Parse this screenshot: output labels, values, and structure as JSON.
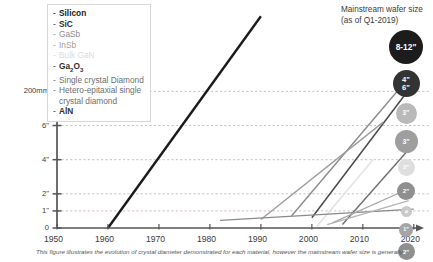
{
  "chart_data": {
    "type": "line",
    "title": "",
    "xlabel": "",
    "ylabel": "",
    "xlim": [
      1950,
      2022
    ],
    "ylim": [
      0,
      13
    ],
    "grid": "horizontal-dashed",
    "legend_position": "top-left-inside",
    "x_ticks": [
      "1950",
      "1960",
      "1970",
      "1980",
      "1990",
      "2000",
      "2010",
      "2020"
    ],
    "x_tick_values": [
      1950,
      1960,
      1970,
      1980,
      1990,
      2000,
      2010,
      2020
    ],
    "y_ticks": [
      "0",
      "1\"",
      "2\"",
      "4\"",
      "6\"",
      "200mm"
    ],
    "y_tick_values": [
      0,
      1,
      2,
      4,
      6,
      8
    ],
    "series": [
      {
        "name": "Silicon",
        "color": "#1a1a1a",
        "width": 2.4,
        "points": [
          [
            1960,
            0
          ],
          [
            1990,
            12.4
          ]
        ]
      },
      {
        "name": "SiC",
        "color": "#4a4a4a",
        "width": 1.5,
        "points": [
          [
            2000,
            0.6
          ],
          [
            2019,
            8.1
          ]
        ]
      },
      {
        "name": "GaSb",
        "color": "#8c8c8c",
        "width": 1.4,
        "points": [
          [
            1996,
            0.7
          ],
          [
            2017,
            8.1
          ]
        ]
      },
      {
        "name": "InSb",
        "color": "#9d9d9d",
        "width": 1.4,
        "points": [
          [
            1990,
            0.5
          ],
          [
            2014,
            6.2
          ]
        ]
      },
      {
        "name": "Bulk GaN",
        "color": "#e2e2e2",
        "width": 1.4,
        "points": [
          [
            2001,
            0.1
          ],
          [
            2012,
            4.0
          ]
        ]
      },
      {
        "name": "Ga2O3",
        "color": "#6e6e6e",
        "width": 1.4,
        "points": [
          [
            2006,
            0.2
          ],
          [
            2019,
            4.6
          ]
        ]
      },
      {
        "name": "Single crystal Diamond",
        "color": "#8a8a8a",
        "width": 1.3,
        "points": [
          [
            1982,
            0.45
          ],
          [
            2020,
            1.1
          ]
        ]
      },
      {
        "name": "Hetero-epitaxial single crystal diamond",
        "color": "#a8a8a8",
        "width": 1.3,
        "points": [
          [
            2004,
            0.3
          ],
          [
            2019,
            2.3
          ]
        ]
      },
      {
        "name": "AlN",
        "color": "#b5b5b5",
        "width": 1.3,
        "points": [
          [
            2003,
            0.2
          ],
          [
            2019,
            1.6
          ]
        ]
      }
    ]
  },
  "legend": {
    "items": [
      {
        "dash": "-",
        "label": "Silicon",
        "color": "#1a1a1a",
        "strong": true
      },
      {
        "dash": "-",
        "label": "SiC",
        "color": "#2e2e2e",
        "strong": true
      },
      {
        "dash": "-",
        "label": "GaSb",
        "color": "#8c8c8c",
        "strong": false
      },
      {
        "dash": "-",
        "label": "InSb",
        "color": "#9d9d9d",
        "strong": false
      },
      {
        "dash": "-",
        "label": "Bulk GaN",
        "color": "#dcdcdc",
        "strong": false
      },
      {
        "dash": "-",
        "label": "Ga2O3",
        "color": "#2e2e2e",
        "strong": true
      },
      {
        "dash": "-",
        "label": "Single crystal Diamond",
        "color": "#6e6e6e",
        "strong": false
      },
      {
        "dash": "-",
        "label": "Hetero-epitaxial single crystal diamond",
        "color": "#6e6e6e",
        "strong": false
      },
      {
        "dash": "-",
        "label": "AlN",
        "color": "#2e2e2e",
        "strong": true
      }
    ]
  },
  "mainstream": {
    "title_line1": "Mainstream wafer size",
    "title_line2": "(as of Q1-2019)",
    "badges": [
      {
        "label": "8-12\"",
        "sub": "",
        "color": "#1c1c1c",
        "size": 34,
        "font": 8.4
      },
      {
        "label": "4\"",
        "sub": "6\"",
        "color": "#333333",
        "size": 27,
        "font": 7.6
      },
      {
        "label": "3\"",
        "sub": "",
        "color": "#b9b9b9",
        "size": 21,
        "font": 6.6
      },
      {
        "label": "3\"",
        "sub": "",
        "color": "#9e9e9e",
        "size": 23,
        "font": 7.0
      },
      {
        "label": "2\"",
        "sub": "",
        "color": "#dedede",
        "size": 17,
        "font": 5.8
      },
      {
        "label": "2\"",
        "sub": "",
        "color": "#8f8f8f",
        "size": 18,
        "font": 6.2
      },
      {
        "label": "⌀",
        "sub": "",
        "color": "#c9c9c9",
        "size": 11,
        "font": 5.0
      },
      {
        "label": "1\"",
        "sub": "",
        "color": "#a5a5a5",
        "size": 14,
        "font": 5.4
      },
      {
        "label": "2\"",
        "sub": "",
        "color": "#8f8f8f",
        "size": 17,
        "font": 6.0
      }
    ]
  },
  "caption": {
    "text": "This figure illustrates the evolution of crystal diameter demonstrated for each material, however the mainstream wafer size is generally"
  },
  "colors": {
    "axis": "#555555",
    "grid": "#c0a0a8",
    "background": "#ffffff"
  }
}
